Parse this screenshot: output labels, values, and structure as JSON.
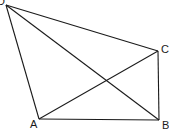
{
  "diagram": {
    "type": "geometry-quadrilateral-with-diagonals",
    "vertices": [
      {
        "label": "D",
        "x": 6,
        "y": 5,
        "lx": -3,
        "ly": 5
      },
      {
        "label": "C",
        "x": 158,
        "y": 51,
        "lx": 161,
        "ly": 53
      },
      {
        "label": "B",
        "x": 159,
        "y": 120,
        "lx": 162,
        "ly": 129
      },
      {
        "label": "A",
        "x": 39,
        "y": 119,
        "lx": 30,
        "ly": 128
      }
    ],
    "edges": [
      {
        "name": "edge-DC",
        "from": "D",
        "to": "C"
      },
      {
        "name": "edge-CB",
        "from": "C",
        "to": "B"
      },
      {
        "name": "edge-BA",
        "from": "B",
        "to": "A"
      },
      {
        "name": "edge-AD",
        "from": "A",
        "to": "D"
      },
      {
        "name": "diagonal-DB",
        "from": "D",
        "to": "B"
      },
      {
        "name": "diagonal-AC",
        "from": "A",
        "to": "C"
      }
    ],
    "stroke_color": "#1a1a1a",
    "background": "#ffffff"
  }
}
